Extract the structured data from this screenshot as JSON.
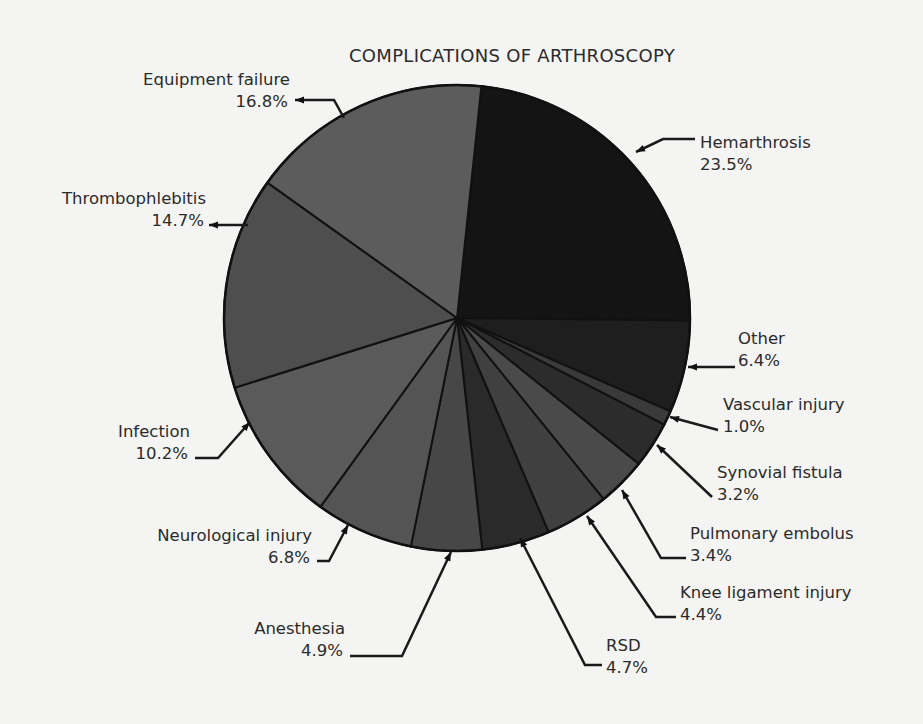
{
  "chart_data": {
    "type": "pie",
    "title": "COMPLICATIONS OF ARTHROSCOPY",
    "center": [
      457,
      318
    ],
    "radius": 233,
    "start_angle_deg": 6,
    "slices": [
      {
        "label": "Hemarthrosis",
        "value": 23.5,
        "pct": "23.5%",
        "color": "#141414",
        "tx": 700,
        "ty": 170,
        "anchor": "start",
        "leader": [
          [
            636,
            152
          ],
          [
            663,
            139
          ],
          [
            695,
            139
          ]
        ]
      },
      {
        "label": "Other",
        "value": 6.4,
        "pct": "6.4%",
        "color": "#1e1e1e",
        "tx": 738,
        "ty": 366,
        "anchor": "start",
        "leader": [
          [
            688,
            367
          ],
          [
            735,
            367
          ]
        ]
      },
      {
        "label": "Vascular injury",
        "value": 1.0,
        "pct": "1.0%",
        "color": "#3a3a3a",
        "tx": 723,
        "ty": 432,
        "anchor": "start",
        "leader": [
          [
            670,
            417
          ],
          [
            718,
            430
          ]
        ]
      },
      {
        "label": "Synovial fistula",
        "value": 3.2,
        "pct": "3.2%",
        "color": "#2c2c2c",
        "tx": 717,
        "ty": 500,
        "anchor": "start",
        "leader": [
          [
            657,
            445
          ],
          [
            712,
            497
          ]
        ]
      },
      {
        "label": "Pulmonary embolus",
        "value": 3.4,
        "pct": "3.4%",
        "color": "#4a4a4a",
        "tx": 690,
        "ty": 561,
        "anchor": "start",
        "leader": [
          [
            622,
            490
          ],
          [
            661,
            558
          ],
          [
            686,
            558
          ]
        ]
      },
      {
        "label": "Knee ligament injury",
        "value": 4.4,
        "pct": "4.4%",
        "color": "#404040",
        "tx": 680,
        "ty": 620,
        "anchor": "start",
        "leader": [
          [
            587,
            516
          ],
          [
            656,
            617
          ],
          [
            676,
            617
          ]
        ]
      },
      {
        "label": "RSD",
        "value": 4.7,
        "pct": "4.7%",
        "color": "#2a2a2a",
        "tx": 606,
        "ty": 673,
        "anchor": "start",
        "leader": [
          [
            520,
            538
          ],
          [
            585,
            665
          ],
          [
            602,
            665
          ]
        ]
      },
      {
        "label": "Anesthesia",
        "value": 4.9,
        "pct": "4.9%",
        "color": "#474747",
        "tx": 345,
        "ty": 656,
        "anchor": "end",
        "leader": [
          [
            451,
            552
          ],
          [
            402,
            656
          ],
          [
            350,
            656
          ]
        ]
      },
      {
        "label": "Neurological injury",
        "value": 6.8,
        "pct": "6.8%",
        "color": "#545454",
        "tx": 312,
        "ty": 563,
        "anchor": "end",
        "leader": [
          [
            348,
            525
          ],
          [
            329,
            561
          ],
          [
            317,
            561
          ]
        ]
      },
      {
        "label": "Infection",
        "value": 10.2,
        "pct": "10.2%",
        "color": "#5a5a5a",
        "tx": 190,
        "ty": 459,
        "anchor": "end",
        "leader": [
          [
            250,
            422
          ],
          [
            218,
            458
          ],
          [
            195,
            458
          ]
        ]
      },
      {
        "label": "Thrombophlebitis",
        "value": 14.7,
        "pct": "14.7%",
        "color": "#4e4e4e",
        "tx": 206,
        "ty": 226,
        "anchor": "end",
        "leader": [
          [
            209,
            225
          ],
          [
            248,
            225
          ]
        ]
      },
      {
        "label": "Equipment failure",
        "value": 16.8,
        "pct": "16.8%",
        "color": "#5c5c5c",
        "tx": 290,
        "ty": 107,
        "anchor": "end",
        "leader": [
          [
            295,
            100
          ],
          [
            334,
            100
          ],
          [
            344,
            118
          ]
        ]
      }
    ]
  }
}
